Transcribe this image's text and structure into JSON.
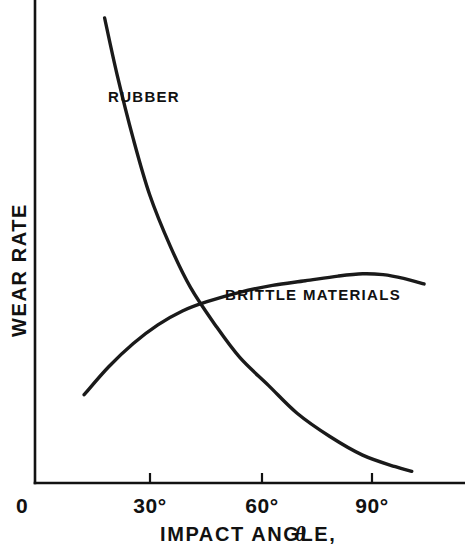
{
  "chart_data": {
    "type": "line",
    "title": "",
    "xlabel": "IMPACT ANGLE, θ",
    "xlabel_main": "IMPACT ANGLE,",
    "xlabel_symbol": "θ",
    "ylabel": "WEAR RATE",
    "xlim": [
      0,
      105
    ],
    "ylim": [
      0,
      100
    ],
    "xticks": [
      0,
      30,
      60,
      90
    ],
    "xtick_labels": [
      "0",
      "30°",
      "60°",
      "90°"
    ],
    "yticks": [],
    "ytick_labels": [],
    "grid": false,
    "legend": "inline-annotations",
    "line_color": "#1a1a1a",
    "background_color": "#ffffff",
    "series": [
      {
        "name": "RUBBER",
        "label": "RUBBER",
        "label_x": 32,
        "label_y": 82,
        "x": [
          17,
          20,
          24,
          28,
          33,
          38,
          44,
          50,
          57,
          64,
          72,
          80,
          88,
          92
        ],
        "y": [
          100,
          88,
          74,
          62,
          51,
          42,
          34,
          27,
          21,
          15,
          10,
          6,
          3.5,
          2.5
        ]
      },
      {
        "name": "BRITTLE MATERIALS",
        "label": "BRITTLE MATERIALS",
        "label_x": 53,
        "label_y": 47,
        "x": [
          12,
          18,
          24,
          30,
          36,
          42,
          50,
          58,
          66,
          74,
          80,
          85,
          90,
          95
        ],
        "y": [
          19,
          25,
          30,
          34,
          37,
          39,
          41,
          42.5,
          43.5,
          44.5,
          45,
          44.8,
          44,
          42.8
        ]
      }
    ],
    "annotations": [
      {
        "text": "RUBBER",
        "kind": "curve-label"
      },
      {
        "text": "BRITTLE MATERIALS",
        "kind": "curve-label"
      }
    ]
  }
}
